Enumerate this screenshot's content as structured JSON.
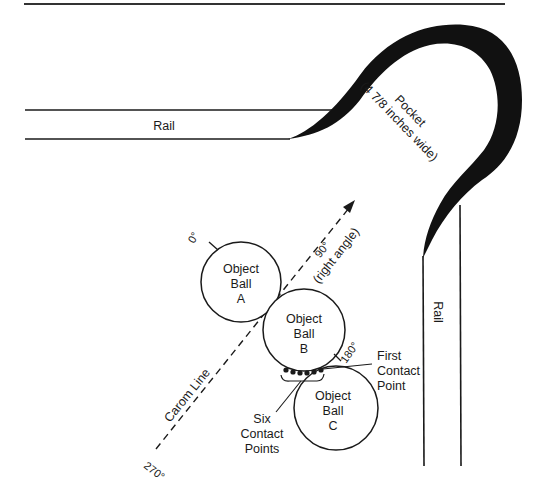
{
  "header": {
    "page_number_fragment": "",
    "rule": true
  },
  "rails": {
    "top": {
      "label": "Rail"
    },
    "right": {
      "label": "Rail"
    }
  },
  "pocket": {
    "label_line1": "Pocket",
    "label_line2": "(4 7/8 inches wide)"
  },
  "balls": [
    {
      "id": "A",
      "line1": "Object",
      "line2": "Ball",
      "line3": "A"
    },
    {
      "id": "B",
      "line1": "Object",
      "line2": "Ball",
      "line3": "B"
    },
    {
      "id": "C",
      "line1": "Object",
      "line2": "Ball",
      "line3": "C"
    }
  ],
  "angles": {
    "zero": "0°",
    "ninety": "90°",
    "ninety_note": "(right angle)",
    "one_eighty": "180°",
    "two_seventy": "270°"
  },
  "carom_line": {
    "label": "Carom Line"
  },
  "annotations": {
    "first_contact": [
      "First",
      "Contact",
      "Point"
    ],
    "six_contact": [
      "Six",
      "Contact",
      "Points"
    ],
    "six_contact_count": 6
  },
  "colors": {
    "ink": "#1a1a1a",
    "pocket_fill": "#111111",
    "paper": "#ffffff"
  }
}
